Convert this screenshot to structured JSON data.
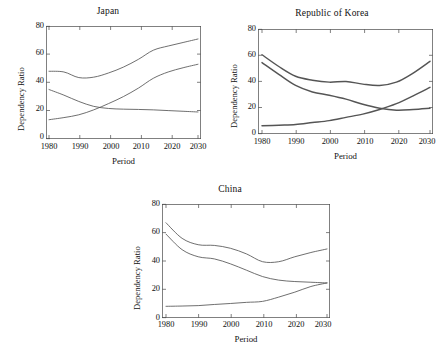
{
  "figure": {
    "background": "#ffffff",
    "line_color": "#555555",
    "axis_color": "#4a4a4a"
  },
  "panels": [
    {
      "id": "japan",
      "title": "Japan",
      "xlabel": "Period",
      "ylabel": "Dependency Ratio"
    },
    {
      "id": "korea",
      "title": "Republic of Korea",
      "xlabel": "Period",
      "ylabel": "Dependency Ratio"
    },
    {
      "id": "china",
      "title": "China",
      "xlabel": "Period",
      "ylabel": "Dependency Ratio"
    }
  ],
  "axis": {
    "xticks": [
      "1980",
      "1990",
      "2000",
      "2010",
      "2020",
      "2030"
    ],
    "yticks": [
      "0",
      "20",
      "40",
      "60",
      "80"
    ]
  },
  "chart_data": [
    {
      "type": "line",
      "title": "Japan",
      "xlabel": "Period",
      "ylabel": "Dependency Ratio",
      "xlim": [
        1980,
        2030
      ],
      "ylim": [
        0,
        80
      ],
      "xticks": [
        1980,
        1990,
        2000,
        2010,
        2020,
        2030
      ],
      "yticks": [
        0,
        20,
        40,
        60,
        80
      ],
      "grid": false,
      "legend": "none",
      "x": [
        1980,
        1985,
        1990,
        1995,
        2000,
        2005,
        2010,
        2015,
        2020,
        2025,
        2030
      ],
      "series": [
        {
          "name": "Total dependency ratio",
          "values": [
            48.0,
            47.5,
            43.5,
            43.8,
            46.8,
            51.0,
            56.5,
            63.0,
            66.0,
            68.5,
            71.0
          ]
        },
        {
          "name": "Child dependency ratio",
          "values": [
            35.0,
            31.0,
            26.5,
            23.0,
            21.5,
            21.0,
            20.8,
            20.5,
            20.0,
            19.5,
            19.0
          ]
        },
        {
          "name": "Old-age dependency ratio",
          "values": [
            13.5,
            15.0,
            17.0,
            20.5,
            25.0,
            30.0,
            36.0,
            43.0,
            47.5,
            50.5,
            53.0
          ]
        }
      ]
    },
    {
      "type": "line",
      "title": "Republic of Korea",
      "xlabel": "Period",
      "ylabel": "Dependency Ratio",
      "xlim": [
        1980,
        2030
      ],
      "ylim": [
        0,
        80
      ],
      "xticks": [
        1980,
        1990,
        2000,
        2010,
        2020,
        2030
      ],
      "yticks": [
        0,
        20,
        40,
        60,
        80
      ],
      "grid": false,
      "legend": "none",
      "x": [
        1980,
        1985,
        1990,
        1995,
        2000,
        2005,
        2010,
        2015,
        2020,
        2025,
        2030
      ],
      "series": [
        {
          "name": "Total dependency ratio",
          "values": [
            60.5,
            51.5,
            44.0,
            41.0,
            39.5,
            40.0,
            38.0,
            37.0,
            39.5,
            46.5,
            55.5
          ]
        },
        {
          "name": "Child dependency ratio",
          "values": [
            54.5,
            45.5,
            37.0,
            32.0,
            29.5,
            26.5,
            22.5,
            19.5,
            18.0,
            18.5,
            19.5
          ]
        },
        {
          "name": "Old-age dependency ratio",
          "values": [
            6.0,
            6.5,
            7.0,
            8.5,
            10.0,
            12.5,
            15.0,
            18.5,
            23.0,
            29.0,
            35.5
          ]
        }
      ]
    },
    {
      "type": "line",
      "title": "China",
      "xlabel": "Period",
      "ylabel": "Dependency Ratio",
      "xlim": [
        1980,
        2030
      ],
      "ylim": [
        0,
        80
      ],
      "xticks": [
        1980,
        1990,
        2000,
        2010,
        2020,
        2030
      ],
      "yticks": [
        0,
        20,
        40,
        60,
        80
      ],
      "grid": false,
      "legend": "none",
      "x": [
        1980,
        1985,
        1990,
        1995,
        2000,
        2005,
        2010,
        2015,
        2020,
        2025,
        2030
      ],
      "series": [
        {
          "name": "Total dependency ratio",
          "values": [
            67.0,
            56.0,
            51.5,
            51.0,
            49.0,
            45.0,
            39.5,
            39.5,
            43.0,
            46.0,
            48.5
          ]
        },
        {
          "name": "Child dependency ratio",
          "values": [
            59.0,
            48.0,
            43.0,
            41.5,
            38.0,
            33.5,
            29.0,
            26.5,
            25.5,
            25.0,
            24.5
          ]
        },
        {
          "name": "Old-age dependency ratio",
          "values": [
            8.0,
            8.2,
            8.5,
            9.3,
            10.0,
            10.8,
            11.5,
            14.5,
            18.0,
            22.0,
            24.5
          ]
        }
      ]
    }
  ]
}
